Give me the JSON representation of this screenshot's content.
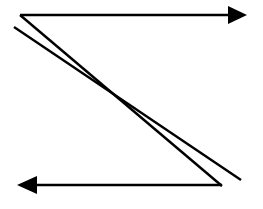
{
  "canvas": {
    "width": 263,
    "height": 209,
    "background_color": "#ffffff",
    "title": "Zigzag scan path diagram"
  },
  "style": {
    "stroke_color": "#000000",
    "fill_color": "#000000",
    "line_width": 2.6,
    "diagonal_line_width": 2.4
  },
  "figure": {
    "name": "z-shaped-scan-path",
    "shapes": [
      {
        "id": "top-arrow",
        "kind": "arrow",
        "direction": "right",
        "x1": 20,
        "y1": 15,
        "x2": 247,
        "y2": 15,
        "arrowhead": {
          "at": "end",
          "tip_x": 247,
          "tip_y": 15,
          "base_x": 228,
          "half_height": 9,
          "points": "247,15 228,6 228,24"
        }
      },
      {
        "id": "diagonal-upper",
        "kind": "line",
        "x1": 20,
        "y1": 15,
        "x2": 222,
        "y2": 186
      },
      {
        "id": "diagonal-lower",
        "kind": "line",
        "x1": 14,
        "y1": 27,
        "x2": 241,
        "y2": 180
      },
      {
        "id": "bottom-arrow",
        "kind": "arrow",
        "direction": "left",
        "x1": 222,
        "y1": 185,
        "x2": 17,
        "y2": 185,
        "arrowhead": {
          "at": "end",
          "tip_x": 17,
          "tip_y": 185,
          "base_x": 37,
          "half_height": 9,
          "points": "17,185 37,176 37,194"
        }
      }
    ]
  },
  "labels": {
    "top_arrow": "",
    "bottom_arrow": "",
    "diagonal": ""
  }
}
